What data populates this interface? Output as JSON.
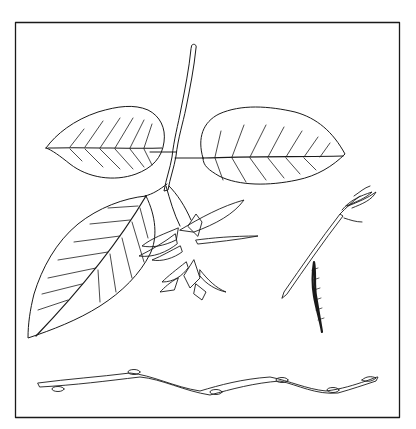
{
  "figure": {
    "unit_label": "cm",
    "x_scale": {
      "min": 0,
      "max": 14,
      "major_step": 2,
      "minor_step": 1,
      "labels": [
        "2",
        "4",
        "6",
        "8",
        "10",
        "12",
        "14"
      ]
    },
    "y_scale": {
      "min": 0,
      "max": 14,
      "major_step": 2,
      "minor_step": 1,
      "labels": [
        "0",
        "2",
        "4",
        "6",
        "8",
        "10",
        "12",
        "14"
      ]
    },
    "ink_color": "#1a1a1a",
    "paper_color": "#ffffff",
    "parts": [
      "leafy-shoot-with-three-leaves",
      "fruit-bract-cluster",
      "flowering-twig-with-male-catkin",
      "winter-twig-with-buds"
    ]
  }
}
